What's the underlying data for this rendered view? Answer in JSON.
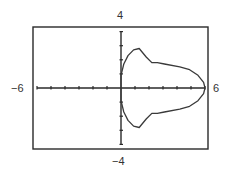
{
  "chart_data": {
    "type": "line",
    "title": "",
    "xlabel": "",
    "ylabel": "",
    "xlim": [
      -6,
      6
    ],
    "ylim": [
      -4,
      4
    ],
    "xscale_ticks": 1,
    "yscale_ticks": 1,
    "grid": false,
    "legend": null,
    "window_labels": {
      "xmin": "−6",
      "xmax": "6",
      "ymin": "−4",
      "ymax": "4"
    },
    "series": [
      {
        "name": "curve",
        "closed": true,
        "points": [
          [
            0.0,
            0.9
          ],
          [
            0.2,
            1.7
          ],
          [
            0.5,
            2.3
          ],
          [
            0.9,
            2.7
          ],
          [
            1.3,
            2.8
          ],
          [
            1.8,
            2.2
          ],
          [
            2.2,
            1.8
          ],
          [
            2.6,
            1.8
          ],
          [
            3.1,
            1.7
          ],
          [
            4.2,
            1.5
          ],
          [
            4.9,
            1.3
          ],
          [
            5.5,
            0.9
          ],
          [
            5.9,
            0.4
          ],
          [
            6.0,
            0.0
          ],
          [
            5.9,
            -0.4
          ],
          [
            5.5,
            -0.9
          ],
          [
            4.9,
            -1.3
          ],
          [
            4.2,
            -1.5
          ],
          [
            3.1,
            -1.7
          ],
          [
            2.6,
            -1.8
          ],
          [
            2.2,
            -1.8
          ],
          [
            1.8,
            -2.2
          ],
          [
            1.3,
            -2.8
          ],
          [
            0.9,
            -2.7
          ],
          [
            0.5,
            -2.3
          ],
          [
            0.2,
            -1.7
          ],
          [
            0.0,
            -0.9
          ]
        ]
      }
    ]
  }
}
